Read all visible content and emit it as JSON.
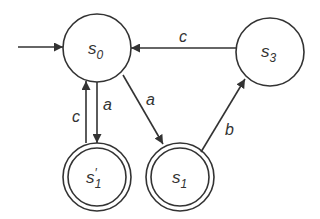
{
  "diagram": {
    "type": "finite-state-automaton",
    "stroke_color": "#333333",
    "background": "#ffffff",
    "states": [
      {
        "id": "s0",
        "base": "s",
        "prime": "",
        "sub": "0",
        "initial": true,
        "accepting": false
      },
      {
        "id": "s3",
        "base": "s",
        "prime": "",
        "sub": "3",
        "initial": false,
        "accepting": false
      },
      {
        "id": "s1p",
        "base": "s",
        "prime": "′",
        "sub": "1",
        "initial": false,
        "accepting": true
      },
      {
        "id": "s1",
        "base": "s",
        "prime": "",
        "sub": "1",
        "initial": false,
        "accepting": true
      }
    ],
    "transitions": [
      {
        "from": "s3",
        "to": "s0",
        "label": "c"
      },
      {
        "from": "s0",
        "to": "s1p",
        "label": "a"
      },
      {
        "from": "s1p",
        "to": "s0",
        "label": "c"
      },
      {
        "from": "s0",
        "to": "s1",
        "label": "a"
      },
      {
        "from": "s1",
        "to": "s3",
        "label": "b"
      }
    ]
  }
}
